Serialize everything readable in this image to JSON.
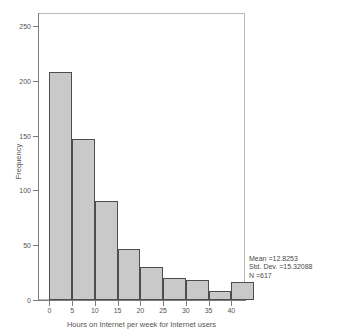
{
  "figure": {
    "clipped_top_text": [
      "",
      "",
      ""
    ],
    "background_color": "#ffffff",
    "frame_color": "#b9b9b9"
  },
  "chart_data": {
    "type": "bar",
    "title": "",
    "subtitle": "",
    "xlabel": "Hours on Internet per week for Internet users",
    "ylabel": "Frequency",
    "bin_width": 5,
    "categories": [
      "0-5",
      "5-10",
      "10-15",
      "15-20",
      "20-25",
      "25-30",
      "30-35",
      "35-40",
      "40-45"
    ],
    "bin_starts": [
      0,
      5,
      10,
      15,
      20,
      25,
      30,
      35,
      40
    ],
    "values": [
      208,
      147,
      90,
      47,
      30,
      20,
      18,
      8,
      16
    ],
    "xlim": [
      -2.5,
      43
    ],
    "ylim": [
      0,
      262
    ],
    "xticks": [
      0,
      5,
      10,
      15,
      20,
      25,
      30,
      35,
      40
    ],
    "xticklabels": [
      "0",
      "5",
      "10",
      "15",
      "20",
      "25",
      "30",
      "35",
      "40"
    ],
    "yticks": [
      0,
      50,
      100,
      150,
      200,
      250
    ],
    "yticklabels": [
      "0",
      "50",
      "100",
      "150",
      "200",
      "250"
    ],
    "grid": false,
    "legend": false,
    "bar_fill_color": "#c9c9c9",
    "bar_edge_color": "#4d4d4d",
    "annotations": {
      "mean": "Mean =12.8253",
      "std_dev": "Std. Dev. =15.32088",
      "n": "N =617"
    }
  }
}
